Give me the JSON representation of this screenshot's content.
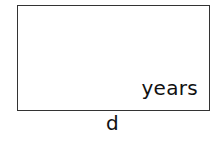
{
  "diagram": {
    "box": {
      "label": "years",
      "border_color": "#333333"
    },
    "caption": "d"
  }
}
